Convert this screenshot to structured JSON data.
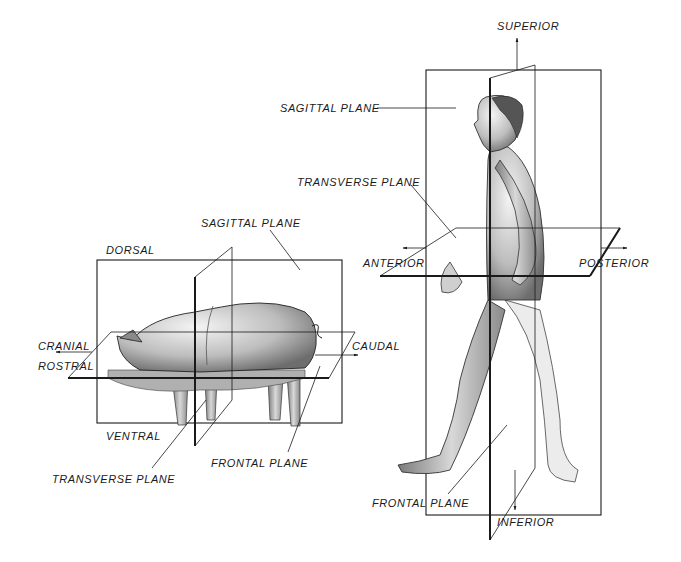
{
  "pig_diagram": {
    "labels": {
      "sagittal": "SAGITTAL PLANE",
      "dorsal": "DORSAL",
      "cranial": "CRANIAL",
      "rostral": "ROSTRAL",
      "caudal": "CAUDAL",
      "ventral": "VENTRAL",
      "transverse": "TRANSVERSE PLANE",
      "frontal": "FRONTAL PLANE"
    }
  },
  "human_diagram": {
    "labels": {
      "superior": "SUPERIOR",
      "sagittal": "SAGITTAL PLANE",
      "transverse": "TRANSVERSE PLANE",
      "anterior": "ANTERIOR",
      "posterior": "POSTERIOR",
      "frontal": "FRONTAL PLANE",
      "inferior": "INFERIOR"
    }
  }
}
